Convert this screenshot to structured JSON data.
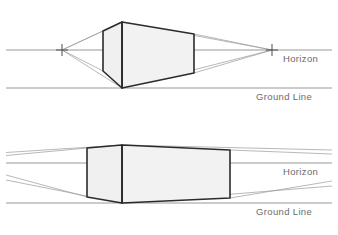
{
  "diagram": {
    "background_color": "#ffffff",
    "box_fill_color": "#f2f2f2",
    "box_stroke_color": "#2b2b2b",
    "guide_line_color": "#9a9a9a",
    "reference_line_color": "#8c8c8c",
    "label_color": "#6b6b6b"
  },
  "panels": [
    {
      "name": "upper-panel",
      "description": "Box near the vanishing points, strong convergence",
      "horizon": {
        "label": "Horizon",
        "y": 50,
        "x_start": 6,
        "x_end": 332
      },
      "ground": {
        "label": "Ground Line",
        "y": 88,
        "x_start": 6,
        "x_end": 332
      },
      "vanishing_points": [
        {
          "name": "left-vanishing-point",
          "x": 62,
          "y": 50,
          "marker": "cross"
        },
        {
          "name": "right-vanishing-point",
          "x": 272,
          "y": 50,
          "marker": "cross"
        }
      ],
      "box": {
        "name": "upper-box",
        "front_edge_x": 122,
        "front_top_y": 22,
        "front_bottom_y": 88,
        "left_edge_x": 103,
        "left_top_y": 31,
        "left_bottom_y": 71,
        "right_edge_x": 194,
        "right_top_y": 34,
        "right_bottom_y": 73
      }
    },
    {
      "name": "lower-panel",
      "description": "Box far from the vanishing points, shallow convergence",
      "horizon": {
        "label": "Horizon",
        "y": 163,
        "x_start": 6,
        "x_end": 332
      },
      "ground": {
        "label": "Ground Line",
        "y": 203,
        "x_start": 6,
        "x_end": 332
      },
      "vanishing_points": [
        {
          "name": "left-vanishing-point-offscreen",
          "x": -330,
          "y": 163,
          "marker": "none"
        },
        {
          "name": "right-vanishing-point-offscreen",
          "x": 660,
          "y": 163,
          "marker": "none"
        }
      ],
      "box": {
        "name": "lower-box",
        "front_edge_x": 122,
        "front_top_y": 145,
        "front_bottom_y": 203,
        "left_edge_x": 87,
        "left_top_y": 148,
        "left_bottom_y": 197,
        "right_edge_x": 230,
        "right_top_y": 150,
        "right_bottom_y": 198
      }
    }
  ],
  "labels": {
    "horizon_upper": "Horizon",
    "ground_upper": "Ground Line",
    "horizon_lower": "Horizon",
    "ground_lower": "Ground Line"
  }
}
